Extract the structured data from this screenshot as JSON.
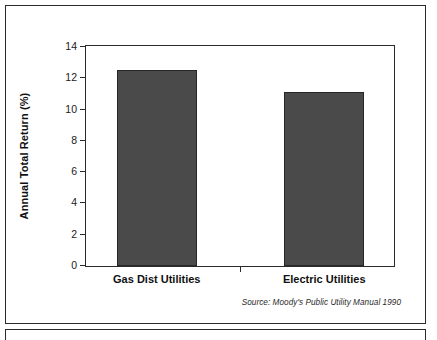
{
  "figure": {
    "source_note": "Source: Moody's Public Utility Manual 1990"
  },
  "chart_data": {
    "type": "bar",
    "title": "",
    "subtitle": "",
    "xlabel": "",
    "ylabel": "Annual Total Return (%)",
    "categories": [
      "Gas Dist Utilities",
      "Electric Utilities"
    ],
    "values": [
      12.5,
      11.1
    ],
    "ylim": [
      0,
      14
    ],
    "yticks": [
      0,
      2,
      4,
      6,
      8,
      10,
      12,
      14
    ],
    "ytick_labels": [
      "0",
      "2",
      "4",
      "6",
      "8",
      "10",
      "12",
      "14"
    ],
    "grid": false,
    "legend": null,
    "legend_position": "none",
    "bar_color": "#4a4a4a",
    "bar_edge_color": "#262626",
    "axis_color": "#2b2b2b",
    "background": "#ffffff",
    "annotations": [
      "Source: Moody's Public Utility Manual 1990"
    ]
  }
}
